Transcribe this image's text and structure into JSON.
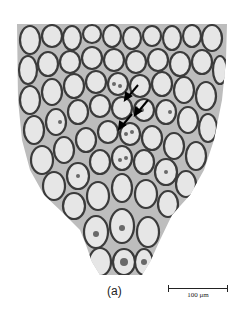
{
  "figure": {
    "panel_label": "(a)",
    "scale_bar": {
      "label": "100 μm",
      "length_px": 60
    },
    "arrows": [
      {
        "x": 130,
        "y": 95
      },
      {
        "x": 140,
        "y": 110
      },
      {
        "x": 124,
        "y": 124
      }
    ],
    "colors": {
      "background": "#ffffff",
      "cell_wall": "#3a3a3a",
      "cytoplasm": "#d8d8d8",
      "nucleus": "#4a4a4a"
    }
  }
}
